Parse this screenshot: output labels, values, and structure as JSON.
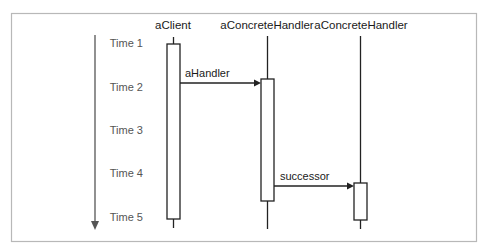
{
  "diagram": {
    "type": "sequence-diagram",
    "colors": {
      "frame": "#b8b8b8",
      "time_axis": "#555555",
      "lines": "#222222",
      "background": "#ffffff"
    },
    "time_axis": {
      "labels": [
        "Time 1",
        "Time 2",
        "Time 3",
        "Time 4",
        "Time 5"
      ],
      "direction": "down-arrow"
    },
    "participants": [
      {
        "name": "aClient"
      },
      {
        "name": "aConcreteHandler"
      },
      {
        "name": "aConcreteHandler"
      }
    ],
    "messages": [
      {
        "label": "aHandler",
        "from": 0,
        "to": 1
      },
      {
        "label": "successor",
        "from": 1,
        "to": 2
      }
    ]
  }
}
